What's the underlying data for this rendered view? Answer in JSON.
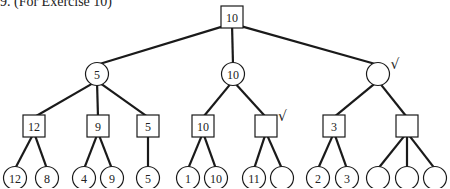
{
  "caption": "9. (For Exercise 10)",
  "colors": {
    "stroke": "#1a1a1a",
    "fill": "#ffffff",
    "text": "#222222"
  },
  "tree": {
    "nodes": [
      {
        "id": "root",
        "shape": "square",
        "x": 232,
        "y": 17,
        "label": "10",
        "check": false
      },
      {
        "id": "a",
        "shape": "circle",
        "x": 97,
        "y": 74,
        "label": "5",
        "check": false,
        "parent": "root"
      },
      {
        "id": "b",
        "shape": "circle",
        "x": 233,
        "y": 74,
        "label": "10",
        "check": false,
        "parent": "root"
      },
      {
        "id": "c",
        "shape": "circle",
        "x": 378,
        "y": 74,
        "label": "",
        "check": true,
        "parent": "root"
      },
      {
        "id": "a1",
        "shape": "square",
        "x": 34,
        "y": 126,
        "label": "12",
        "check": false,
        "parent": "a"
      },
      {
        "id": "a2",
        "shape": "square",
        "x": 98,
        "y": 126,
        "label": "9",
        "check": false,
        "parent": "a"
      },
      {
        "id": "a3",
        "shape": "square",
        "x": 148,
        "y": 126,
        "label": "5",
        "check": false,
        "parent": "a"
      },
      {
        "id": "b1",
        "shape": "square",
        "x": 203,
        "y": 126,
        "label": "10",
        "check": false,
        "parent": "b"
      },
      {
        "id": "b2",
        "shape": "square",
        "x": 266,
        "y": 126,
        "label": "",
        "check": true,
        "parent": "b"
      },
      {
        "id": "c1",
        "shape": "square",
        "x": 334,
        "y": 126,
        "label": "3",
        "check": false,
        "parent": "c"
      },
      {
        "id": "c2",
        "shape": "square",
        "x": 407,
        "y": 126,
        "label": "",
        "check": false,
        "parent": "c"
      },
      {
        "id": "l1",
        "shape": "circle",
        "x": 15,
        "y": 178,
        "label": "12",
        "check": false,
        "parent": "a1"
      },
      {
        "id": "l2",
        "shape": "circle",
        "x": 47,
        "y": 178,
        "label": "8",
        "check": false,
        "parent": "a1"
      },
      {
        "id": "l3",
        "shape": "circle",
        "x": 84,
        "y": 178,
        "label": "4",
        "check": false,
        "parent": "a2"
      },
      {
        "id": "l4",
        "shape": "circle",
        "x": 112,
        "y": 178,
        "label": "9",
        "check": false,
        "parent": "a2"
      },
      {
        "id": "l5",
        "shape": "circle",
        "x": 148,
        "y": 178,
        "label": "5",
        "check": false,
        "parent": "a3"
      },
      {
        "id": "l6",
        "shape": "circle",
        "x": 188,
        "y": 178,
        "label": "1",
        "check": false,
        "parent": "b1"
      },
      {
        "id": "l7",
        "shape": "circle",
        "x": 216,
        "y": 178,
        "label": "10",
        "check": false,
        "parent": "b1"
      },
      {
        "id": "l8",
        "shape": "circle",
        "x": 254,
        "y": 178,
        "label": "11",
        "check": false,
        "parent": "b2"
      },
      {
        "id": "l9",
        "shape": "circle",
        "x": 282,
        "y": 178,
        "label": "",
        "check": false,
        "parent": "b2"
      },
      {
        "id": "l10",
        "shape": "circle",
        "x": 318,
        "y": 178,
        "label": "2",
        "check": false,
        "parent": "c1"
      },
      {
        "id": "l11",
        "shape": "circle",
        "x": 347,
        "y": 178,
        "label": "3",
        "check": false,
        "parent": "c1"
      },
      {
        "id": "l12",
        "shape": "circle",
        "x": 378,
        "y": 178,
        "label": "",
        "check": false,
        "parent": "c2"
      },
      {
        "id": "l13",
        "shape": "circle",
        "x": 407,
        "y": 178,
        "label": "",
        "check": false,
        "parent": "c2"
      },
      {
        "id": "l14",
        "shape": "circle",
        "x": 435,
        "y": 178,
        "label": "",
        "check": false,
        "parent": "c2"
      }
    ]
  }
}
